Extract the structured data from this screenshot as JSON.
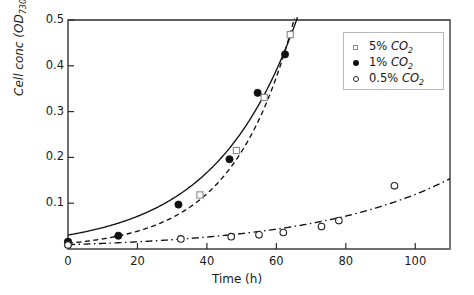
{
  "chart_data": {
    "type": "scatter",
    "title": "",
    "xlabel": "Time (h)",
    "ylabel": "Cell conc (OD730)",
    "ylabel_base": "Cell conc (OD",
    "ylabel_sub": "730",
    "ylabel_tail": ")",
    "xlim": [
      0,
      110
    ],
    "ylim": [
      0,
      0.5
    ],
    "xticks": [
      0,
      20,
      40,
      60,
      80,
      100
    ],
    "xtick_labels": [
      "0",
      "20",
      "40",
      "60",
      "80",
      "100"
    ],
    "yticks": [
      0.1,
      0.2,
      0.3,
      0.4,
      0.5
    ],
    "ytick_labels": [
      "0.1",
      "0.2",
      "0.3",
      "0.4",
      "0.5"
    ],
    "grid": false,
    "legend_position": "upper right",
    "series": [
      {
        "name": "5% CO2",
        "label_prefix": "5% ",
        "label_gas": "CO",
        "label_sub": "2",
        "marker": "open-square",
        "line_style": "dashed",
        "points": [
          {
            "x": 0,
            "y": 0.013
          },
          {
            "x": 38,
            "y": 0.118
          },
          {
            "x": 48.5,
            "y": 0.215
          },
          {
            "x": 56.5,
            "y": 0.331
          },
          {
            "x": 64,
            "y": 0.468
          }
        ],
        "fit_curve": {
          "y0": 0.0125,
          "rate": 0.0567,
          "x_start": 0,
          "x_end": 65.5
        }
      },
      {
        "name": "1% CO2",
        "label_prefix": "1% ",
        "label_gas": "CO",
        "label_sub": "2",
        "marker": "filled-circle",
        "line_style": "solid",
        "points": [
          {
            "x": 0,
            "y": 0.016
          },
          {
            "x": 14.5,
            "y": 0.029
          },
          {
            "x": 31.8,
            "y": 0.097
          },
          {
            "x": 46.5,
            "y": 0.196
          },
          {
            "x": 54.6,
            "y": 0.341
          },
          {
            "x": 62.5,
            "y": 0.425
          }
        ],
        "fit_curve": {
          "y0": 0.0305,
          "rate": 0.0425,
          "x_start": 0,
          "x_end": 67
        }
      },
      {
        "name": "0.5% CO2",
        "label_prefix": "0.5% ",
        "label_gas": "CO",
        "label_sub": "2",
        "marker": "open-circle",
        "line_style": "dash-dot",
        "points": [
          {
            "x": 0,
            "y": 0.009
          },
          {
            "x": 32.5,
            "y": 0.022
          },
          {
            "x": 47,
            "y": 0.027
          },
          {
            "x": 55,
            "y": 0.031
          },
          {
            "x": 62,
            "y": 0.036
          },
          {
            "x": 73,
            "y": 0.049
          },
          {
            "x": 78,
            "y": 0.062
          },
          {
            "x": 94,
            "y": 0.138
          }
        ],
        "fit_curve": {
          "y0": 0.0095,
          "rate": 0.0253,
          "x_start": 0,
          "x_end": 110
        }
      }
    ]
  },
  "axes": {
    "x_title": "Time (h)",
    "y_title_base": "Cell conc (OD",
    "y_title_sub": "730",
    "y_title_tail": ")"
  },
  "legend": {
    "items": [
      {
        "marker": "open-square",
        "prefix": "5% ",
        "gas": "CO",
        "sub": "2"
      },
      {
        "marker": "filled-circle",
        "prefix": "1% ",
        "gas": "CO",
        "sub": "2"
      },
      {
        "marker": "open-circle",
        "prefix": "0.5% ",
        "gas": "CO",
        "sub": "2"
      }
    ]
  },
  "colors": {
    "axis": "#6e6e6e",
    "frame": "#2b2b2b",
    "text": "#141414",
    "marker_dark": "#111111",
    "marker_light": "#8a8a8a",
    "legend_border": "#b9b9b9"
  }
}
